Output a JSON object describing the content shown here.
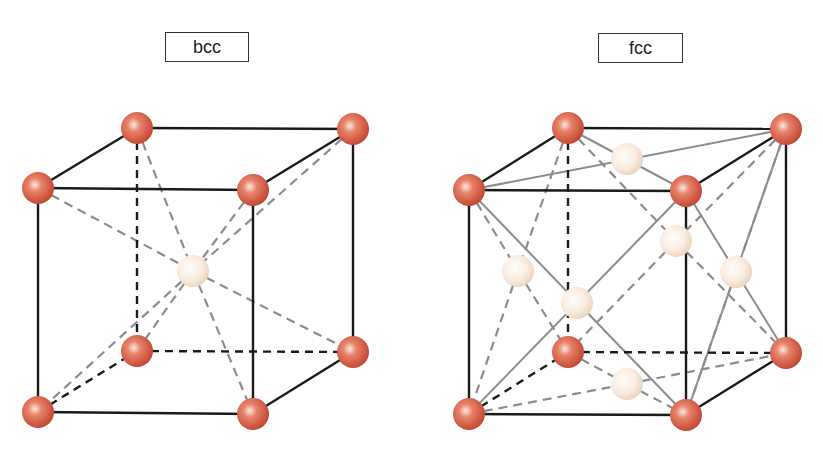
{
  "diagrams": [
    {
      "id": "bcc",
      "label": "bcc",
      "label_box": {
        "x": 165,
        "y": 32,
        "w": 84,
        "h": 30
      },
      "corner_atoms": [
        [
          137,
          128
        ],
        [
          353,
          129
        ],
        [
          38,
          188
        ],
        [
          253,
          190
        ],
        [
          137,
          351
        ],
        [
          353,
          352
        ],
        [
          38,
          412
        ],
        [
          253,
          414
        ]
      ],
      "center_atoms": [
        [
          193,
          271
        ]
      ],
      "visible_edges": [
        [
          38,
          188,
          253,
          190
        ],
        [
          137,
          128,
          353,
          129
        ],
        [
          38,
          188,
          137,
          128
        ],
        [
          253,
          190,
          353,
          129
        ],
        [
          38,
          188,
          38,
          412
        ],
        [
          253,
          190,
          253,
          414
        ],
        [
          353,
          129,
          353,
          352
        ],
        [
          38,
          412,
          253,
          414
        ],
        [
          253,
          414,
          353,
          352
        ]
      ],
      "hidden_edges": [
        [
          137,
          128,
          137,
          351
        ],
        [
          137,
          351,
          353,
          352
        ],
        [
          38,
          412,
          137,
          351
        ]
      ],
      "diagonals_dashed": [
        [
          38,
          188,
          193,
          271
        ],
        [
          193,
          271,
          353,
          352
        ],
        [
          137,
          128,
          193,
          271
        ],
        [
          193,
          271,
          253,
          414
        ],
        [
          353,
          129,
          193,
          271
        ],
        [
          193,
          271,
          38,
          412
        ],
        [
          253,
          190,
          193,
          271
        ],
        [
          193,
          271,
          137,
          351
        ]
      ],
      "diagonals_solid": []
    },
    {
      "id": "fcc",
      "label": "fcc",
      "label_box": {
        "x": 598,
        "y": 33,
        "w": 85,
        "h": 30
      },
      "corner_atoms": [
        [
          568,
          128
        ],
        [
          786,
          129
        ],
        [
          469,
          190
        ],
        [
          686,
          191
        ],
        [
          568,
          352
        ],
        [
          786,
          353
        ],
        [
          469,
          414
        ],
        [
          686,
          415
        ]
      ],
      "center_atoms": [
        [
          627,
          159
        ],
        [
          676,
          241
        ],
        [
          518,
          271
        ],
        [
          736,
          272
        ],
        [
          577,
          303
        ],
        [
          627,
          384
        ]
      ],
      "visible_edges": [
        [
          469,
          190,
          686,
          191
        ],
        [
          568,
          128,
          786,
          129
        ],
        [
          469,
          190,
          568,
          128
        ],
        [
          686,
          191,
          786,
          129
        ],
        [
          469,
          190,
          469,
          414
        ],
        [
          686,
          191,
          686,
          415
        ],
        [
          786,
          129,
          786,
          353
        ],
        [
          469,
          414,
          686,
          415
        ],
        [
          686,
          415,
          786,
          353
        ]
      ],
      "hidden_edges": [
        [
          568,
          128,
          568,
          352
        ],
        [
          568,
          352,
          786,
          353
        ],
        [
          469,
          414,
          568,
          352
        ]
      ],
      "diagonals_dashed": [
        [
          568,
          128,
          676,
          241
        ],
        [
          676,
          241,
          786,
          353
        ],
        [
          786,
          129,
          676,
          241
        ],
        [
          676,
          241,
          568,
          352
        ],
        [
          469,
          190,
          518,
          271
        ],
        [
          518,
          271,
          568,
          352
        ],
        [
          568,
          128,
          518,
          271
        ],
        [
          518,
          271,
          469,
          414
        ],
        [
          469,
          414,
          627,
          384
        ],
        [
          627,
          384,
          786,
          353
        ],
        [
          568,
          352,
          627,
          384
        ],
        [
          627,
          384,
          686,
          415
        ],
        [
          786,
          129,
          736,
          272
        ],
        [
          736,
          272,
          686,
          415
        ]
      ],
      "diagonals_solid": [
        [
          469,
          190,
          786,
          129
        ],
        [
          568,
          128,
          686,
          191
        ],
        [
          469,
          190,
          686,
          415
        ],
        [
          686,
          191,
          469,
          414
        ],
        [
          686,
          191,
          786,
          353
        ],
        [
          786,
          129,
          686,
          415
        ]
      ]
    }
  ],
  "colors": {
    "corner_atom_dark": "#c8503a",
    "corner_atom_mid": "#e07a60",
    "corner_atom_light": "#fbe3d6",
    "center_atom_dark": "#efd9c8",
    "center_atom_light": "#fffaf4",
    "edge": "#1a1a1a",
    "diagonal": "#8c8c8c"
  },
  "atom_radius": 16
}
